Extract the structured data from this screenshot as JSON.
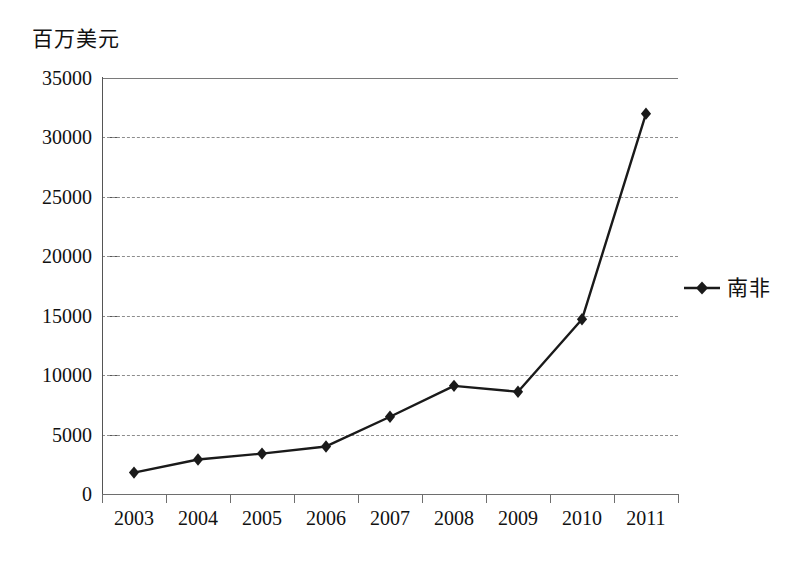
{
  "chart_data": {
    "type": "line",
    "title": "",
    "subtitle": "",
    "xlabel": "",
    "ylabel": "百万美元",
    "categories": [
      "2003",
      "2004",
      "2005",
      "2006",
      "2007",
      "2008",
      "2009",
      "2010",
      "2011"
    ],
    "series": [
      {
        "name": "南非",
        "values": [
          1800,
          2900,
          3400,
          4000,
          6500,
          9100,
          8600,
          14700,
          32000
        ],
        "color": "#1a1a1a",
        "marker": "diamond"
      }
    ],
    "ylim": [
      0,
      35000
    ],
    "yticks": [
      0,
      5000,
      10000,
      15000,
      20000,
      25000,
      30000,
      35000
    ],
    "ytick_labels": [
      "0",
      "5000",
      "10000",
      "15000",
      "20000",
      "25000",
      "30000",
      "35000"
    ],
    "grid": true,
    "grid_axis": "y",
    "grid_style": "dashed",
    "legend_position": "right",
    "legend_entries": [
      "南非"
    ]
  },
  "axes": {
    "y_title": "百万美元"
  },
  "legend": {
    "series_label": "南非",
    "marker_icon": "diamond-marker-icon"
  }
}
